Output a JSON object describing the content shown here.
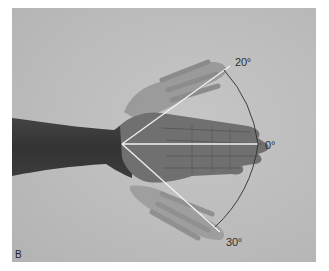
{
  "figure": {
    "panel_label": "B",
    "angles": {
      "upper": {
        "label": "20°",
        "degrees": 20
      },
      "neutral": {
        "label": "0°",
        "degrees": 0
      },
      "lower": {
        "label": "30°",
        "degrees": 30
      }
    },
    "colors": {
      "background": "#bdbdbd",
      "forearm": "#3a3a3a",
      "hand": "#6e6e6e",
      "ghost_hand": "#8f8f8f",
      "guide_line": "#f4f4f4",
      "arc": "#3a3a3a"
    }
  },
  "caption": {
    "text": ""
  }
}
